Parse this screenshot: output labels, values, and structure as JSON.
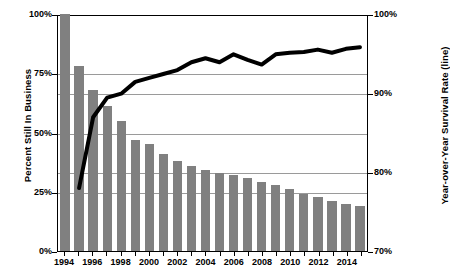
{
  "chart_data": {
    "type": "bar",
    "title": "",
    "subtitle": "",
    "xlabel": "",
    "ylabel": "Percent Still In Business",
    "ylabel_right": "Year-over-Year Survival Rate (line)",
    "grid": true,
    "legend_position": "none",
    "ylim": [
      0,
      100
    ],
    "ylim_right": [
      70,
      100
    ],
    "yticks": [
      "0%",
      "25%",
      "50%",
      "75%",
      "100%"
    ],
    "yticks_right": [
      "70%",
      "80%",
      "90%",
      "100%"
    ],
    "categories": [
      1994,
      1995,
      1996,
      1997,
      1998,
      1999,
      2000,
      2001,
      2002,
      2003,
      2004,
      2005,
      2006,
      2007,
      2008,
      2009,
      2010,
      2011,
      2012,
      2013,
      2014,
      2015
    ],
    "xtick_labels": [
      "1994",
      "",
      "1996",
      "",
      "1998",
      "",
      "2000",
      "",
      "2002",
      "",
      "2004",
      "",
      "2006",
      "",
      "2008",
      "",
      "2010",
      "",
      "2012",
      "",
      "2014",
      ""
    ],
    "series": [
      {
        "name": "Percent Still In Business",
        "type": "bar",
        "axis": "left",
        "color": "#808080",
        "values": [
          100,
          78,
          68,
          61,
          55,
          47,
          45,
          41,
          38,
          36,
          34,
          33,
          32,
          31,
          29,
          28,
          26,
          24,
          23,
          21,
          20,
          19
        ]
      },
      {
        "name": "Year-over-Year Survival Rate (line)",
        "type": "line",
        "axis": "right",
        "color": "#000000",
        "values": [
          null,
          78.0,
          87.0,
          89.5,
          90.0,
          91.5,
          92.0,
          92.5,
          93.0,
          94.0,
          94.5,
          94.0,
          95.0,
          94.3,
          93.7,
          95.0,
          95.2,
          95.3,
          95.6,
          95.2,
          95.7,
          95.9
        ]
      }
    ]
  },
  "axes": {
    "left_title": "Percent Still In Business",
    "right_title": "Year-over-Year Survival Rate (line)"
  }
}
